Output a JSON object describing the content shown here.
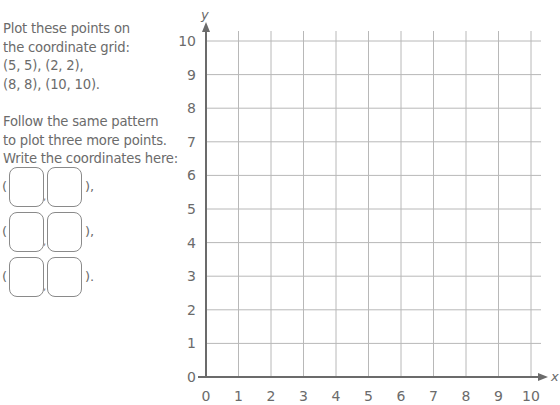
{
  "instructions": {
    "para1": [
      "Plot these points on",
      "the coordinate grid:",
      "(5, 5), (2, 2),",
      "(8, 8), (10, 10)."
    ],
    "para2": [
      "Follow the same pattern",
      "to plot three more points.",
      "Write the coordinates here:"
    ]
  },
  "answer_rows": [
    {
      "open": "(",
      "x_value": "",
      "y_value": "",
      "close": "),"
    },
    {
      "open": "(",
      "x_value": "",
      "y_value": "",
      "close": "),"
    },
    {
      "open": "(",
      "x_value": "",
      "y_value": "",
      "close": ")."
    }
  ],
  "chart_data": {
    "type": "scatter",
    "title": "",
    "xlabel": "x",
    "ylabel": "y",
    "xlim": [
      0,
      10
    ],
    "ylim": [
      0,
      10
    ],
    "x_ticks": [
      "0",
      "1",
      "2",
      "3",
      "4",
      "5",
      "6",
      "7",
      "8",
      "9",
      "10"
    ],
    "y_ticks": [
      "0",
      "1",
      "2",
      "3",
      "4",
      "5",
      "6",
      "7",
      "8",
      "9",
      "10"
    ],
    "grid": true,
    "series": [],
    "points_to_plot": [
      [
        5,
        5
      ],
      [
        2,
        2
      ],
      [
        8,
        8
      ],
      [
        10,
        10
      ]
    ],
    "legend": null
  }
}
